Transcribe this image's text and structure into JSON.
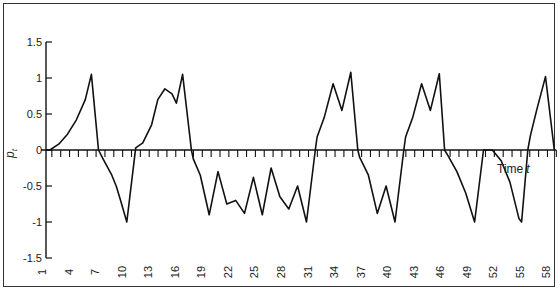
{
  "chart_data": {
    "type": "line",
    "title": "",
    "xlabel": "Time t",
    "ylabel": "p_t",
    "xlim": [
      1,
      59
    ],
    "ylim": [
      -1.5,
      1.5
    ],
    "grid": false,
    "legend": null,
    "x_ticks": [
      1,
      4,
      7,
      10,
      13,
      16,
      19,
      22,
      25,
      28,
      31,
      34,
      37,
      40,
      43,
      46,
      49,
      52,
      55,
      58
    ],
    "y_ticks": [
      1.5,
      1,
      0.5,
      0,
      -0.5,
      -1,
      -1.5
    ],
    "y_tick_labels": [
      "1.5",
      "1",
      "0.5",
      "0",
      "-0.5",
      "-1",
      "-1.5"
    ],
    "series": [
      {
        "name": "p_t",
        "points": [
          [
            1,
            0
          ],
          [
            2,
            0.0
          ],
          [
            3,
            0.08
          ],
          [
            4,
            0.22
          ],
          [
            5,
            0.42
          ],
          [
            6,
            0.7
          ],
          [
            6.7,
            1.05
          ],
          [
            7.5,
            0.0
          ],
          [
            8,
            -0.12
          ],
          [
            9,
            -0.35
          ],
          [
            9.5,
            -0.5
          ],
          [
            10,
            -0.7
          ],
          [
            10.7,
            -1.0
          ],
          [
            11.7,
            0.03
          ],
          [
            12.5,
            0.1
          ],
          [
            13.5,
            0.35
          ],
          [
            14.2,
            0.7
          ],
          [
            15,
            0.85
          ],
          [
            15.8,
            0.78
          ],
          [
            16.3,
            0.65
          ],
          [
            17,
            1.05
          ],
          [
            18,
            0.0
          ],
          [
            18.2,
            -0.12
          ],
          [
            19,
            -0.35
          ],
          [
            20,
            -0.9
          ],
          [
            21,
            -0.3
          ],
          [
            22,
            -0.75
          ],
          [
            23,
            -0.7
          ],
          [
            24,
            -0.88
          ],
          [
            25,
            -0.38
          ],
          [
            26,
            -0.9
          ],
          [
            27,
            -0.25
          ],
          [
            28,
            -0.65
          ],
          [
            29,
            -0.82
          ],
          [
            30,
            -0.5
          ],
          [
            31,
            -1.0
          ],
          [
            32,
            0.0
          ],
          [
            32.2,
            0.18
          ],
          [
            33,
            0.45
          ],
          [
            34,
            0.92
          ],
          [
            35,
            0.55
          ],
          [
            36,
            1.08
          ],
          [
            36.8,
            0.0
          ],
          [
            37,
            -0.1
          ],
          [
            38,
            -0.35
          ],
          [
            39,
            -0.88
          ],
          [
            40,
            -0.5
          ],
          [
            41,
            -1.0
          ],
          [
            42,
            0.0
          ],
          [
            42.2,
            0.18
          ],
          [
            43,
            0.45
          ],
          [
            44,
            0.92
          ],
          [
            45,
            0.55
          ],
          [
            46,
            1.06
          ],
          [
            46.6,
            0.0
          ],
          [
            47,
            -0.08
          ],
          [
            48,
            -0.3
          ],
          [
            49,
            -0.6
          ],
          [
            50,
            -1.0
          ],
          [
            51,
            0.0
          ],
          [
            52,
            0.0
          ],
          [
            53,
            -0.15
          ],
          [
            54,
            -0.45
          ],
          [
            55,
            -0.95
          ],
          [
            55.3,
            -1.0
          ],
          [
            56,
            0.0
          ],
          [
            56.3,
            0.2
          ],
          [
            57,
            0.55
          ],
          [
            58,
            1.02
          ],
          [
            59,
            0.0
          ]
        ]
      }
    ]
  },
  "axes": {
    "y_label_main": "p",
    "y_label_sub": "t",
    "x_label_main": "Time",
    "x_label_var": "t"
  }
}
